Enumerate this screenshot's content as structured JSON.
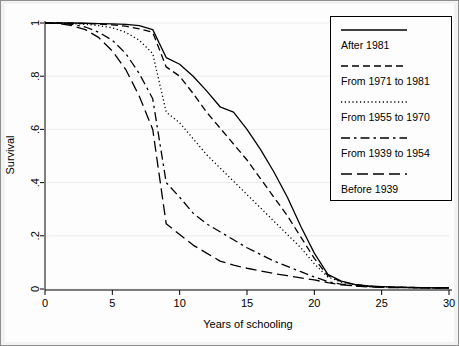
{
  "figure": {
    "background_color": "#fdfdfd",
    "frame_color": "#8f8f8f",
    "line_color": "#000000"
  },
  "chart_data": {
    "type": "line",
    "title": "",
    "subtitle": "",
    "xlabel": "Years of schooling",
    "ylabel": "Survival",
    "xlim": [
      0,
      30
    ],
    "ylim": [
      0,
      1
    ],
    "xticks": [
      0,
      5,
      10,
      15,
      20,
      25,
      30
    ],
    "xtick_labels": [
      "0",
      "5",
      "10",
      "15",
      "20",
      "25",
      "30"
    ],
    "yticks": [
      0,
      0.2,
      0.4,
      0.6,
      0.8,
      1
    ],
    "ytick_labels": [
      "0",
      ".2",
      ".4",
      ".6",
      ".8",
      "1"
    ],
    "grid": "horizontal-faint",
    "legend_position": "top-right",
    "x": [
      0,
      1,
      2,
      3,
      4,
      5,
      6,
      7,
      8,
      9,
      10,
      11,
      12,
      13,
      14,
      15,
      16,
      17,
      18,
      19,
      20,
      21,
      22,
      23,
      24,
      25,
      26,
      27,
      28,
      29,
      30
    ],
    "series": [
      {
        "name": "After 1981",
        "dash": "solid",
        "values": [
          1.0,
          1.0,
          1.0,
          0.999,
          0.998,
          0.997,
          0.995,
          0.99,
          0.975,
          0.87,
          0.845,
          0.8,
          0.745,
          0.685,
          0.665,
          0.6,
          0.525,
          0.44,
          0.345,
          0.235,
          0.135,
          0.055,
          0.03,
          0.017,
          0.012,
          0.009,
          0.007,
          0.006,
          0.005,
          0.004,
          0.004
        ]
      },
      {
        "name": "From 1971 to 1981",
        "dash": "dashed",
        "values": [
          1.0,
          1.0,
          0.999,
          0.998,
          0.996,
          0.993,
          0.988,
          0.978,
          0.965,
          0.835,
          0.8,
          0.735,
          0.665,
          0.605,
          0.545,
          0.485,
          0.415,
          0.345,
          0.275,
          0.195,
          0.115,
          0.05,
          0.028,
          0.016,
          0.011,
          0.008,
          0.007,
          0.006,
          0.005,
          0.004,
          0.004
        ]
      },
      {
        "name": "From 1955 to 1970",
        "dash": "dotted",
        "values": [
          1.0,
          1.0,
          0.998,
          0.995,
          0.99,
          0.982,
          0.965,
          0.935,
          0.885,
          0.665,
          0.625,
          0.565,
          0.505,
          0.455,
          0.405,
          0.355,
          0.305,
          0.255,
          0.205,
          0.155,
          0.095,
          0.045,
          0.026,
          0.015,
          0.01,
          0.008,
          0.007,
          0.006,
          0.005,
          0.004,
          0.004
        ]
      },
      {
        "name": "From 1939 to 1954",
        "dash": "dash-dot",
        "values": [
          1.0,
          0.999,
          0.995,
          0.985,
          0.965,
          0.935,
          0.885,
          0.81,
          0.715,
          0.4,
          0.345,
          0.285,
          0.245,
          0.215,
          0.185,
          0.155,
          0.13,
          0.105,
          0.085,
          0.065,
          0.045,
          0.028,
          0.018,
          0.012,
          0.009,
          0.007,
          0.006,
          0.005,
          0.004,
          0.004,
          0.004
        ]
      },
      {
        "name": "Before 1939",
        "dash": "long-dash",
        "values": [
          1.0,
          0.998,
          0.99,
          0.975,
          0.945,
          0.895,
          0.825,
          0.725,
          0.6,
          0.245,
          0.205,
          0.165,
          0.135,
          0.105,
          0.09,
          0.078,
          0.068,
          0.058,
          0.05,
          0.042,
          0.034,
          0.024,
          0.016,
          0.011,
          0.008,
          0.006,
          0.005,
          0.005,
          0.004,
          0.004,
          0.004
        ]
      }
    ]
  },
  "legend": {
    "entries": [
      {
        "label": "After 1981",
        "dash": "solid"
      },
      {
        "label": "From 1971 to 1981",
        "dash": "dashed"
      },
      {
        "label": "From 1955 to 1970",
        "dash": "dotted"
      },
      {
        "label": "From 1939 to 1954",
        "dash": "dash-dot"
      },
      {
        "label": "Before 1939",
        "dash": "long-dash"
      }
    ]
  }
}
